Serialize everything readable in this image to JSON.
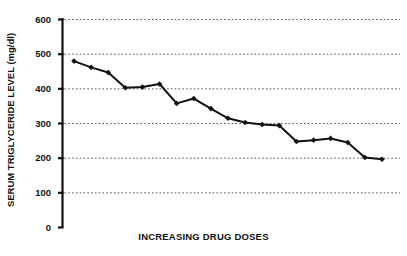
{
  "chart_data": {
    "type": "line",
    "title": "",
    "xlabel": "INCREASING DRUG DOSES",
    "ylabel": "SERUM TRIGLYCERIDE LEVEL (mg/dl)",
    "ylim": [
      0,
      600
    ],
    "ytick_labels": [
      "600",
      "500",
      "400",
      "300",
      "200",
      "100",
      "0"
    ],
    "ytick_values": [
      600,
      500,
      400,
      300,
      200,
      100,
      0
    ],
    "xtick_labels": [],
    "grid": "horizontal-dotted",
    "legend": "none",
    "marker": "filled-diamond",
    "line_color": "#111111",
    "grid_color": "#555555",
    "axis_color": "#111111",
    "series": [
      {
        "name": "Serum triglyceride level",
        "x": [
          1,
          2,
          3,
          4,
          5,
          6,
          7,
          8,
          9,
          10,
          11,
          12,
          13,
          14,
          15,
          16,
          17,
          18,
          19
        ],
        "values": [
          480,
          462,
          447,
          403,
          405,
          414,
          358,
          372,
          343,
          315,
          303,
          297,
          294,
          248,
          252,
          257,
          245,
          202,
          197
        ]
      }
    ]
  }
}
